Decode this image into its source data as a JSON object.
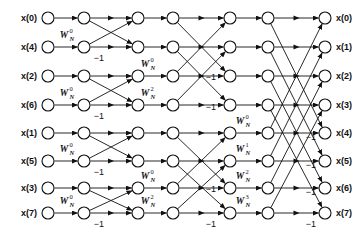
{
  "figure": {
    "type": "diagram",
    "width": 364,
    "height": 236,
    "background": "#ffffff",
    "line_color": "#111111",
    "node_fill": "#ffffff"
  },
  "inputs": [
    {
      "label": "x(0)",
      "row": 0
    },
    {
      "label": "x(4)",
      "row": 1
    },
    {
      "label": "x(2)",
      "row": 2
    },
    {
      "label": "x(6)",
      "row": 3
    },
    {
      "label": "x(1)",
      "row": 4
    },
    {
      "label": "x(5)",
      "row": 5
    },
    {
      "label": "x(3)",
      "row": 6
    },
    {
      "label": "x(7)",
      "row": 7
    }
  ],
  "outputs": [
    {
      "label": "x(0)",
      "row": 0
    },
    {
      "label": "x(1)",
      "row": 1
    },
    {
      "label": "x(2)",
      "row": 2
    },
    {
      "label": "x(3)",
      "row": 3
    },
    {
      "label": "x(4)",
      "row": 4
    },
    {
      "label": "x(5)",
      "row": 5
    },
    {
      "label": "x(6)",
      "row": 6
    },
    {
      "label": "x(7)",
      "row": 7
    }
  ],
  "row_y": [
    18,
    47,
    76,
    105,
    133,
    161,
    188,
    213
  ],
  "column_x": [
    48,
    84,
    138,
    173,
    230,
    268,
    325
  ],
  "node_radius": 6,
  "stages": [
    {
      "name": "stage-1",
      "span": 1,
      "pairs": [
        [
          0,
          1
        ],
        [
          2,
          3
        ],
        [
          4,
          5
        ],
        [
          6,
          7
        ]
      ],
      "twiddles": [
        {
          "row": 1,
          "base": "W",
          "sub": "N",
          "sup": "0",
          "x": 64,
          "y": 38
        },
        {
          "row": 3,
          "base": "W",
          "sub": "N",
          "sup": "0",
          "x": 64,
          "y": 96
        },
        {
          "row": 5,
          "base": "W",
          "sub": "N",
          "sup": "0",
          "x": 64,
          "y": 152
        },
        {
          "row": 7,
          "base": "W",
          "sub": "N",
          "sup": "0",
          "x": 64,
          "y": 204
        }
      ],
      "minus_ones": [
        {
          "x": 99,
          "y": 61
        },
        {
          "x": 99,
          "y": 119
        },
        {
          "x": 99,
          "y": 175
        },
        {
          "x": 99,
          "y": 227
        }
      ]
    },
    {
      "name": "stage-2",
      "span": 2,
      "pairs": [
        [
          0,
          2
        ],
        [
          1,
          3
        ],
        [
          4,
          6
        ],
        [
          5,
          7
        ]
      ],
      "twiddles": [
        {
          "row": 2,
          "base": "W",
          "sub": "N",
          "sup": "0",
          "x": 145,
          "y": 67
        },
        {
          "row": 3,
          "base": "W",
          "sub": "N",
          "sup": "2",
          "x": 145,
          "y": 96
        },
        {
          "row": 6,
          "base": "W",
          "sub": "N",
          "sup": "0",
          "x": 145,
          "y": 179
        },
        {
          "row": 7,
          "base": "W",
          "sub": "N",
          "sup": "2",
          "x": 145,
          "y": 204
        }
      ],
      "minus_ones": [
        {
          "x": 211,
          "y": 80
        },
        {
          "x": 211,
          "y": 110
        },
        {
          "x": 211,
          "y": 192
        },
        {
          "x": 211,
          "y": 227
        }
      ]
    },
    {
      "name": "stage-3",
      "span": 4,
      "pairs": [
        [
          0,
          4
        ],
        [
          1,
          5
        ],
        [
          2,
          6
        ],
        [
          3,
          7
        ]
      ],
      "twiddles": [
        {
          "row": 4,
          "base": "W",
          "sub": "N",
          "sup": "0",
          "x": 240,
          "y": 124
        },
        {
          "row": 5,
          "base": "W",
          "sub": "N",
          "sup": "1",
          "x": 240,
          "y": 152
        },
        {
          "row": 6,
          "base": "W",
          "sub": "N",
          "sup": "2",
          "x": 240,
          "y": 179
        },
        {
          "row": 7,
          "base": "W",
          "sub": "N",
          "sup": "3",
          "x": 240,
          "y": 204
        }
      ],
      "minus_ones": [
        {
          "x": 311,
          "y": 140
        },
        {
          "x": 311,
          "y": 168
        },
        {
          "x": 311,
          "y": 195
        },
        {
          "x": 311,
          "y": 227
        }
      ]
    }
  ],
  "minus_one_text": "−1"
}
